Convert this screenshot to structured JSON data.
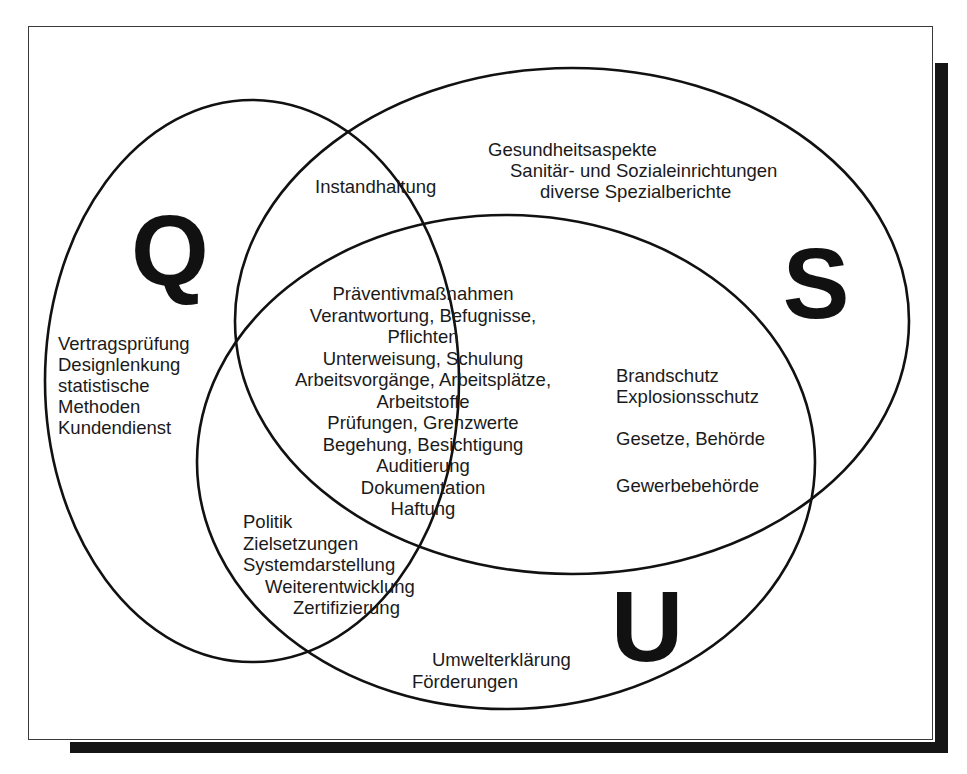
{
  "diagram": {
    "type": "venn",
    "sets": [
      {
        "id": "Q",
        "letter": "Q",
        "ellipse": {
          "cx": 252,
          "cy": 381,
          "rx": 207,
          "ry": 281
        },
        "letter_pos": {
          "x": 170,
          "y": 285,
          "size": 100
        }
      },
      {
        "id": "S",
        "letter": "S",
        "ellipse": {
          "cx": 572,
          "cy": 321,
          "rx": 337,
          "ry": 253
        },
        "letter_pos": {
          "x": 816,
          "y": 318,
          "size": 100
        }
      },
      {
        "id": "U",
        "letter": "U",
        "ellipse": {
          "cx": 506,
          "cy": 462,
          "rx": 309,
          "ry": 247
        },
        "letter_pos": {
          "x": 647,
          "y": 661,
          "size": 100
        }
      }
    ],
    "regions": {
      "q_only": {
        "anchor": "start",
        "x": 58,
        "y": 350,
        "line_height": 21,
        "lines": [
          "Vertragsprüfung",
          "Designlenkung",
          "statistische",
          "Methoden",
          "Kundendienst"
        ]
      },
      "q_and_s": {
        "anchor": "start",
        "x": 315,
        "y": 193,
        "line_height": 21,
        "lines": [
          "Instandhaltung"
        ]
      },
      "s_only": {
        "anchor": "start",
        "x": 488,
        "y": 156,
        "line_height": 21,
        "lines": [
          "Gesundheitsaspekte",
          "  Sanitär- und Sozialeinrichtungen",
          "diverse Spezialberichte"
        ],
        "offsets": [
          0,
          22,
          52
        ]
      },
      "q_s_u": {
        "anchor": "middle",
        "x": 423,
        "y": 300,
        "line_height": 21.5,
        "lines": [
          "Präventivmaßnahmen",
          "Verantwortung, Befugnisse,",
          "Pflichten",
          "Unterweisung, Schulung",
          "Arbeitsvorgänge, Arbeitsplätze,",
          "Arbeitstoffe",
          "Prüfungen, Grenzwerte",
          "Begehung, Besichtigung",
          "Auditierung",
          "Dokumentation",
          "Haftung"
        ]
      },
      "s_and_u": {
        "anchor": "start",
        "x": 616,
        "y": 382,
        "line_height": 21,
        "lines": [
          "Brandschutz",
          "Explosionsschutz",
          "",
          "Gesetze, Behörde",
          "",
          "Gewerbebehörde"
        ],
        "ys": [
          382,
          403,
          445,
          492
        ]
      },
      "q_and_u": {
        "anchor": "start",
        "x": 243,
        "y": 528,
        "line_height": 21.5,
        "lines": [
          "Politik",
          "Zielsetzungen",
          "Systemdarstellung",
          "Weiterentwicklung",
          "Zertifizierung"
        ],
        "offsets": [
          0,
          0,
          0,
          22,
          50
        ]
      },
      "u_only": {
        "anchor": "start",
        "x": 432,
        "y": 666,
        "line_height": 21.5,
        "lines": [
          "Umwelterklärung",
          "Förderungen"
        ],
        "offsets": [
          0,
          -20
        ]
      }
    }
  }
}
